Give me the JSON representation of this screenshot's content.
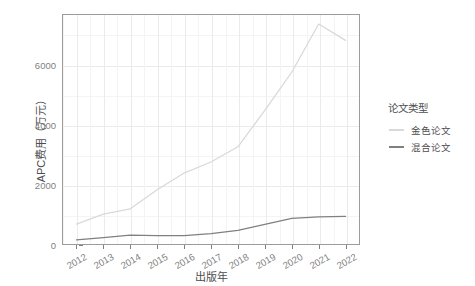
{
  "chart_data": {
    "type": "line",
    "title": "",
    "xlabel": "出版年",
    "ylabel": "APC费用（万元）",
    "x": [
      2012,
      2013,
      2014,
      2015,
      2016,
      2017,
      2018,
      2019,
      2020,
      2021,
      2022
    ],
    "categories": [
      "2012",
      "2013",
      "2014",
      "2015",
      "2016",
      "2017",
      "2018",
      "2019",
      "2020",
      "2021",
      "2022"
    ],
    "series": [
      {
        "name": "金色论文",
        "color": "#d9d9d9",
        "values": [
          670,
          1000,
          1180,
          1820,
          2380,
          2750,
          3260,
          4480,
          5760,
          7380,
          6830
        ]
      },
      {
        "name": "混合论文",
        "color": "#808080",
        "values": [
          135,
          215,
          300,
          280,
          280,
          345,
          460,
          660,
          860,
          910,
          930
        ]
      }
    ],
    "xlim": [
      2011.5,
      2022.5
    ],
    "ylim": [
      0,
      7680
    ],
    "y_ticks": [
      0,
      2000,
      4000,
      6000
    ],
    "y_tick_labels": [
      "0",
      "2000",
      "4000",
      "6000"
    ],
    "x_ticks": [
      2012,
      2013,
      2014,
      2015,
      2016,
      2017,
      2018,
      2019,
      2020,
      2021,
      2022
    ],
    "grid": true,
    "legend_position": "right",
    "legend_title": "论文类型"
  },
  "legend": {
    "title": "论文类型",
    "items": [
      {
        "label": "金色论文",
        "color": "#d9d9d9"
      },
      {
        "label": "混合论文",
        "color": "#808080"
      }
    ]
  },
  "axes": {
    "y_title": "APC费用（万元）",
    "x_title": "出版年"
  },
  "colors": {
    "panel_background": "#ffffff",
    "panel_border": "#9c9c9c",
    "grid_major": "#ebebeb",
    "grid_minor": "#f4f4f4",
    "axis_text": "#7f7f7f",
    "title_text": "#4d4d4d",
    "series_gold": "#d9d9d9",
    "series_hybrid": "#808080"
  }
}
